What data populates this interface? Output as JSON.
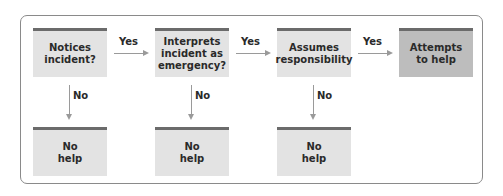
{
  "diagram": {
    "type": "flowchart",
    "steps": [
      {
        "label": "Notices\nincident?"
      },
      {
        "label": "Interprets\nincident as\nemergency?"
      },
      {
        "label": "Assumes\nresponsibility"
      },
      {
        "label": "Attempts\nto help"
      }
    ],
    "outcomes": [
      {
        "label": "No\nhelp"
      },
      {
        "label": "No\nhelp"
      },
      {
        "label": "No\nhelp"
      }
    ],
    "edges": {
      "yes_label": "Yes",
      "no_label": "No"
    },
    "colors": {
      "box_fill": "#e3e3e3",
      "final_box_fill": "#bdbdbd",
      "box_top_bar": "#6b6b6b",
      "arrow": "#9a9a9a",
      "frame_border": "#8a8a8a"
    }
  }
}
